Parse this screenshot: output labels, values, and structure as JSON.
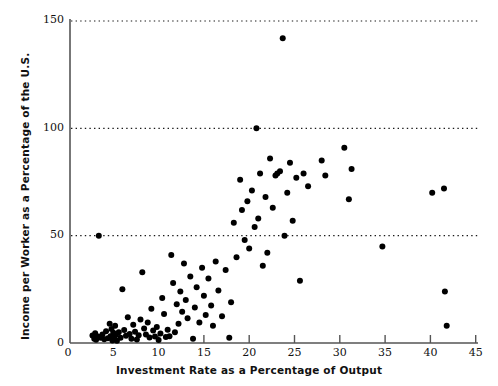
{
  "chart_data": {
    "type": "scatter",
    "title": "",
    "xlabel": "Investment Rate as a Percentage of Output",
    "ylabel": "Income per Worker as a Percentage of the U.S.",
    "xlim": [
      0,
      46
    ],
    "ylim": [
      0,
      152
    ],
    "xticks": [
      0,
      5,
      10,
      15,
      20,
      25,
      30,
      35,
      40,
      45
    ],
    "yticks": [
      0,
      50,
      100,
      150
    ],
    "grid": "horizontal-dotted-at-y-50-100-150",
    "marker": "filled-circle",
    "marker_color": "#000000",
    "legend": "none",
    "points": [
      [
        2.7,
        3.5
      ],
      [
        2.9,
        2.0
      ],
      [
        3.0,
        4.5
      ],
      [
        3.1,
        1.5
      ],
      [
        3.3,
        3.0
      ],
      [
        3.4,
        50.0
      ],
      [
        3.6,
        2.5
      ],
      [
        3.8,
        4.0
      ],
      [
        4.0,
        1.8
      ],
      [
        4.2,
        5.5
      ],
      [
        4.4,
        2.2
      ],
      [
        4.6,
        9.0
      ],
      [
        4.7,
        3.2
      ],
      [
        4.8,
        6.5
      ],
      [
        4.9,
        1.2
      ],
      [
        5.0,
        4.8
      ],
      [
        5.1,
        2.8
      ],
      [
        5.2,
        8.0
      ],
      [
        5.3,
        3.8
      ],
      [
        5.4,
        1.0
      ],
      [
        5.6,
        5.0
      ],
      [
        5.8,
        2.4
      ],
      [
        6.0,
        25.0
      ],
      [
        6.2,
        6.0
      ],
      [
        6.4,
        3.4
      ],
      [
        6.6,
        12.0
      ],
      [
        6.8,
        4.2
      ],
      [
        7.0,
        2.0
      ],
      [
        7.2,
        8.5
      ],
      [
        7.4,
        5.2
      ],
      [
        7.6,
        1.6
      ],
      [
        7.8,
        3.6
      ],
      [
        8.0,
        11.0
      ],
      [
        8.2,
        33.0
      ],
      [
        8.4,
        6.8
      ],
      [
        8.6,
        4.0
      ],
      [
        8.8,
        9.5
      ],
      [
        9.0,
        2.6
      ],
      [
        9.2,
        16.0
      ],
      [
        9.4,
        5.8
      ],
      [
        9.6,
        3.0
      ],
      [
        9.8,
        7.5
      ],
      [
        10.0,
        1.4
      ],
      [
        10.2,
        4.4
      ],
      [
        10.4,
        21.0
      ],
      [
        10.6,
        13.5
      ],
      [
        10.8,
        2.8
      ],
      [
        11.0,
        6.2
      ],
      [
        11.2,
        3.2
      ],
      [
        11.4,
        41.0
      ],
      [
        11.6,
        28.0
      ],
      [
        11.8,
        5.0
      ],
      [
        12.0,
        18.0
      ],
      [
        12.2,
        9.0
      ],
      [
        12.4,
        24.0
      ],
      [
        12.6,
        14.5
      ],
      [
        12.8,
        37.0
      ],
      [
        13.0,
        20.0
      ],
      [
        13.2,
        11.5
      ],
      [
        13.5,
        31.0
      ],
      [
        13.8,
        2.0
      ],
      [
        14.0,
        16.5
      ],
      [
        14.2,
        26.0
      ],
      [
        14.5,
        9.5
      ],
      [
        14.8,
        35.0
      ],
      [
        15.0,
        22.0
      ],
      [
        15.2,
        13.0
      ],
      [
        15.5,
        30.0
      ],
      [
        15.8,
        17.5
      ],
      [
        16.0,
        8.0
      ],
      [
        16.3,
        38.0
      ],
      [
        16.6,
        24.5
      ],
      [
        17.0,
        12.5
      ],
      [
        17.4,
        34.0
      ],
      [
        17.8,
        2.5
      ],
      [
        18.0,
        19.0
      ],
      [
        18.3,
        56.0
      ],
      [
        18.6,
        40.0
      ],
      [
        19.0,
        76.0
      ],
      [
        19.2,
        62.0
      ],
      [
        19.5,
        48.0
      ],
      [
        19.8,
        66.0
      ],
      [
        20.0,
        44.0
      ],
      [
        20.3,
        71.0
      ],
      [
        20.6,
        54.0
      ],
      [
        20.8,
        100.0
      ],
      [
        21.0,
        58.0
      ],
      [
        21.2,
        79.0
      ],
      [
        21.5,
        36.0
      ],
      [
        21.8,
        68.0
      ],
      [
        22.0,
        42.0
      ],
      [
        22.3,
        86.0
      ],
      [
        22.6,
        63.0
      ],
      [
        22.9,
        78.0
      ],
      [
        23.1,
        79.0
      ],
      [
        23.4,
        80.0
      ],
      [
        23.7,
        142.0
      ],
      [
        23.9,
        50.0
      ],
      [
        24.2,
        70.0
      ],
      [
        24.5,
        84.0
      ],
      [
        24.8,
        57.0
      ],
      [
        25.2,
        77.0
      ],
      [
        25.6,
        29.0
      ],
      [
        26.0,
        79.0
      ],
      [
        26.5,
        73.0
      ],
      [
        28.0,
        85.0
      ],
      [
        28.4,
        78.0
      ],
      [
        30.5,
        91.0
      ],
      [
        31.0,
        67.0
      ],
      [
        31.3,
        81.0
      ],
      [
        34.7,
        45.0
      ],
      [
        40.2,
        70.0
      ],
      [
        41.5,
        72.0
      ],
      [
        41.6,
        24.0
      ],
      [
        41.8,
        8.0
      ]
    ]
  }
}
